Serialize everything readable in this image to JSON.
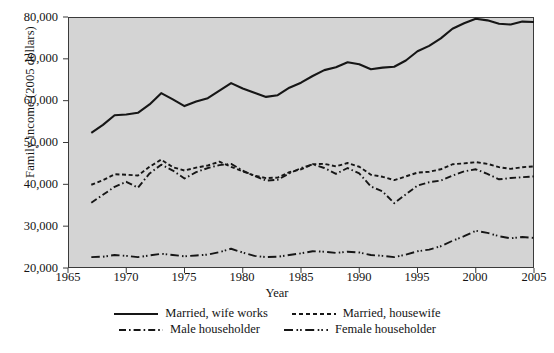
{
  "chart_data": {
    "type": "line",
    "title": "",
    "xlabel": "Year",
    "ylabel": "Family income (2005 dollars)",
    "xlim": [
      1965,
      2005
    ],
    "ylim": [
      20000,
      80000
    ],
    "xticks": [
      "1965",
      "1970",
      "1975",
      "1980",
      "1985",
      "1990",
      "1995",
      "2000",
      "2005"
    ],
    "yticks": [
      "20,000",
      "30,000",
      "40,000",
      "50,000",
      "60,000",
      "70,000",
      "80,000"
    ],
    "grid": false,
    "legend_position": "below-axis",
    "plot_background": "#d4d4d4",
    "line_color": "#161616",
    "x": [
      1967,
      1968,
      1969,
      1970,
      1971,
      1972,
      1973,
      1974,
      1975,
      1976,
      1977,
      1978,
      1979,
      1980,
      1981,
      1982,
      1983,
      1984,
      1985,
      1986,
      1987,
      1988,
      1989,
      1990,
      1991,
      1992,
      1993,
      1994,
      1995,
      1996,
      1997,
      1998,
      1999,
      2000,
      2001,
      2002,
      2003,
      2004,
      2005
    ],
    "series": [
      {
        "name": "Married, wife works",
        "style": "solid",
        "values": [
          52300,
          54200,
          56500,
          56700,
          57100,
          59100,
          61800,
          60300,
          58700,
          59800,
          60600,
          62400,
          64200,
          62900,
          61900,
          60900,
          61300,
          63100,
          64300,
          65900,
          67300,
          68000,
          69200,
          68700,
          67500,
          67900,
          68100,
          69600,
          71800,
          73100,
          74900,
          77200,
          78500,
          79600,
          79200,
          78400,
          78200,
          78900,
          78800
        ]
      },
      {
        "name": "Married, housewife",
        "style": "dashed",
        "values": [
          39900,
          41000,
          42400,
          42300,
          42100,
          44200,
          45900,
          44100,
          43300,
          44000,
          44500,
          45400,
          44200,
          43100,
          42100,
          41500,
          41600,
          42900,
          43600,
          44800,
          44900,
          44300,
          45100,
          44200,
          42300,
          41800,
          41000,
          41900,
          42800,
          43000,
          43600,
          44800,
          45000,
          45300,
          44900,
          44100,
          43700,
          44100,
          44300
        ]
      },
      {
        "name": "Male householder",
        "style": "dash-dot",
        "values": [
          35600,
          37500,
          39400,
          40600,
          39200,
          42600,
          44700,
          43300,
          41400,
          42900,
          43900,
          44600,
          44900,
          43300,
          42000,
          40900,
          41100,
          42600,
          43900,
          44800,
          43900,
          42500,
          43900,
          42600,
          39500,
          38300,
          35500,
          37600,
          39700,
          40500,
          40900,
          42100,
          43100,
          43600,
          42500,
          41200,
          41500,
          41700,
          41900
        ]
      },
      {
        "name": "Female householder",
        "style": "long-dash-dot",
        "values": [
          22600,
          22700,
          23100,
          22900,
          22600,
          23000,
          23400,
          23100,
          22800,
          23000,
          23200,
          23800,
          24600,
          23700,
          22900,
          22600,
          22700,
          23100,
          23500,
          24000,
          23900,
          23600,
          23900,
          23700,
          23100,
          22900,
          22600,
          23200,
          24000,
          24400,
          25200,
          26500,
          27600,
          28900,
          28400,
          27600,
          27100,
          27400,
          27200
        ]
      }
    ]
  },
  "axis": {
    "ylabel": "Family income (2005 dollars)",
    "xlabel": "Year",
    "yticks": [
      "80,000",
      "70,000",
      "60,000",
      "50,000",
      "40,000",
      "30,000",
      "20,000"
    ],
    "xticks": [
      "1965",
      "1970",
      "1975",
      "1980",
      "1985",
      "1990",
      "1995",
      "2000",
      "2005"
    ]
  },
  "legend": {
    "row1": [
      {
        "label": "Married, wife works",
        "style": "solid"
      },
      {
        "label": "Married, housewife",
        "style": "dashed"
      }
    ],
    "row2": [
      {
        "label": "Male householder",
        "style": "dash-dot"
      },
      {
        "label": "Female householder",
        "style": "long-dash-dot"
      }
    ]
  },
  "caption": {
    "text": ""
  }
}
